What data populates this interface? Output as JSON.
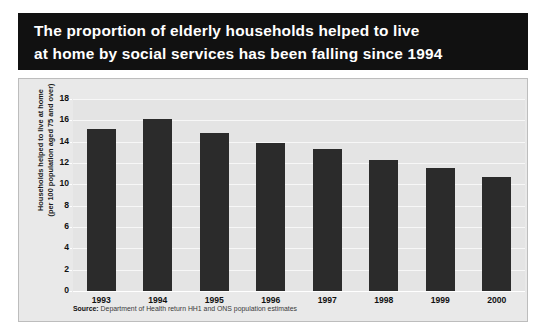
{
  "title": {
    "line1": "The proportion of elderly households helped to live",
    "line2": "at home by social services has been falling since 1994"
  },
  "source": {
    "label": "Source:",
    "text": " Department of Health return HH1 and ONS population estimates"
  },
  "colors": {
    "banner_background": "#111111",
    "banner_text": "#ffffff",
    "panel_background": "#e9e9e9",
    "plot_background": "#e4e4e4",
    "gridline": "#f7f7f7",
    "bar": "#2b2b2b"
  },
  "chart_data": {
    "type": "bar",
    "title": "The proportion of elderly households helped to live at home by social services has been falling since 1994",
    "xlabel": "",
    "ylabel_line1": "Households helped to live at home",
    "ylabel_line2": "(per 100 population aged 75 and over)",
    "categories": [
      "1993",
      "1994",
      "1995",
      "1996",
      "1997",
      "1998",
      "1999",
      "2000"
    ],
    "values": [
      15.2,
      16.1,
      14.8,
      13.9,
      13.3,
      12.3,
      11.5,
      10.7
    ],
    "ylim": [
      0,
      18
    ],
    "yticks": [
      0,
      2,
      4,
      6,
      8,
      10,
      12,
      14,
      16,
      18
    ],
    "ytick_labels": [
      "0",
      "2",
      "4",
      "6",
      "8",
      "10",
      "12",
      "14",
      "16",
      "18"
    ],
    "grid": true,
    "legend": false
  }
}
